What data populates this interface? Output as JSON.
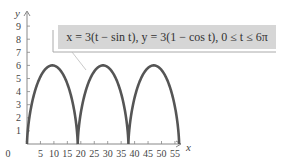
{
  "chart_data": {
    "type": "line",
    "title": "",
    "annotation": "x = 3(t − sin t), y = 3(1 − cos t), 0 ≤ t ≤ 6π",
    "xlabel": "x",
    "ylabel": "y",
    "xlim": [
      0,
      60
    ],
    "ylim": [
      0,
      10
    ],
    "x_ticks": [
      0,
      5,
      10,
      15,
      20,
      25,
      30,
      35,
      40,
      45,
      50,
      55
    ],
    "y_ticks": [
      1,
      2,
      3,
      4,
      5,
      6,
      7,
      8,
      9
    ],
    "grid": false,
    "legend": "none",
    "series": [
      {
        "name": "cycloid",
        "param": "t",
        "x_expr": "3*(t - sin(t))",
        "y_expr": "3*(1 - cos(t))",
        "t_range": [
          0,
          18.8496
        ],
        "cusps_x": [
          0,
          18.85,
          37.7,
          56.55
        ],
        "peaks": [
          [
            9.42,
            6
          ],
          [
            28.27,
            6
          ],
          [
            47.12,
            6
          ]
        ]
      }
    ],
    "colors": {
      "curve": "#555555",
      "axes": "#888888",
      "box": "#d6d6d6"
    }
  },
  "labels": {
    "formula": "x = 3(t − sin t), y = 3(1 − cos t), 0 ≤ t ≤ 6π",
    "x_axis": "x",
    "y_axis": "y",
    "origin": "0"
  }
}
